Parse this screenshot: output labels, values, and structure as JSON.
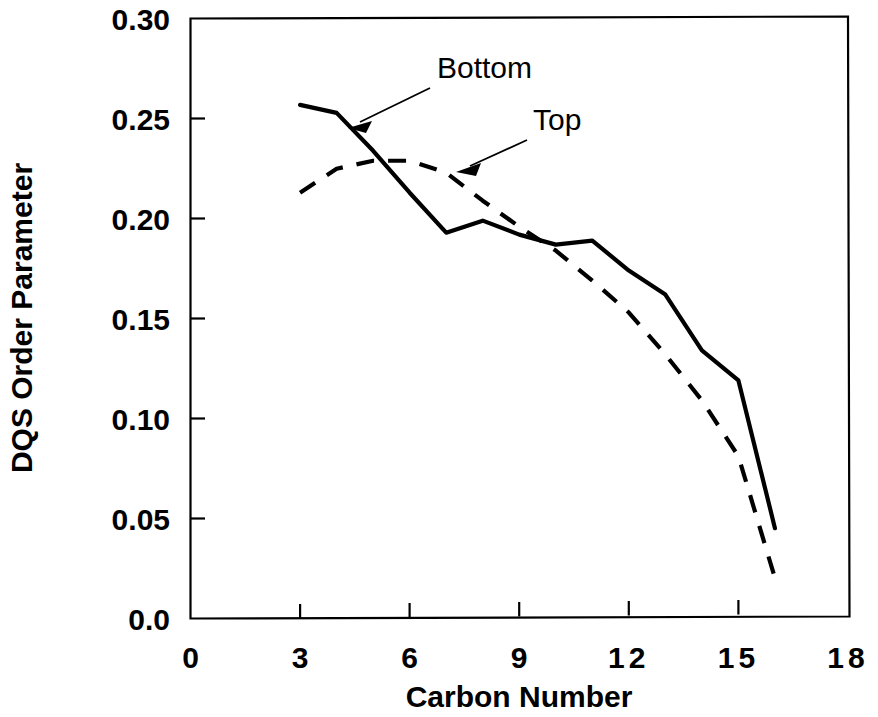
{
  "chart_data": {
    "type": "line",
    "title": "",
    "xlabel": "Carbon  Number",
    "ylabel": "DQS Order Parameter",
    "xlim": [
      0,
      18
    ],
    "ylim": [
      0.0,
      0.3
    ],
    "grid": false,
    "legend_position": "inline-annotations",
    "xticks": [
      "0",
      "3",
      "6",
      "9",
      "12",
      "15",
      "18"
    ],
    "xtick_values": [
      0,
      3,
      6,
      9,
      12,
      15,
      18
    ],
    "yticks": [
      "0.0",
      "0.05",
      "0.10",
      "0.15",
      "0.20",
      "0.25",
      "0.30"
    ],
    "ytick_values": [
      0.0,
      0.05,
      0.1,
      0.15,
      0.2,
      0.25,
      0.3
    ],
    "series": [
      {
        "name": "Bottom",
        "style": "solid",
        "color": "#000000",
        "x": [
          3,
          4,
          5,
          6,
          7,
          8,
          9,
          10,
          11,
          12,
          13,
          14,
          15,
          16
        ],
        "values": [
          0.257,
          0.253,
          0.234,
          0.213,
          0.193,
          0.199,
          0.192,
          0.187,
          0.189,
          0.174,
          0.162,
          0.134,
          0.119,
          0.045
        ]
      },
      {
        "name": "Top",
        "style": "dashed",
        "color": "#000000",
        "x": [
          3,
          4,
          5,
          6,
          7,
          8,
          9,
          10,
          11,
          12,
          13,
          14,
          15,
          16
        ],
        "values": [
          0.213,
          0.225,
          0.229,
          0.229,
          0.223,
          0.209,
          0.196,
          0.184,
          0.169,
          0.153,
          0.132,
          0.109,
          0.081,
          0.02
        ]
      }
    ],
    "annotations": [
      {
        "label": "Bottom",
        "label_x": 437,
        "label_y": 78,
        "points_to_series": "Bottom",
        "arrow_from": [
          430,
          88
        ],
        "arrow_to": [
          351,
          127
        ]
      },
      {
        "label": "Top",
        "label_x": 533,
        "label_y": 130,
        "points_to_series": "Top",
        "arrow_from": [
          527,
          140
        ],
        "arrow_to": [
          452,
          172
        ]
      }
    ]
  }
}
